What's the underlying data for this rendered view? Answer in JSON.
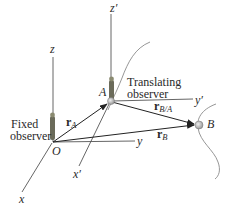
{
  "diagram": {
    "type": "relative-motion-translating-axes",
    "labels": {
      "fixed_z": "z",
      "fixed_x": "x",
      "fixed_y": "y",
      "origin": "O",
      "moving_z": "z′",
      "moving_x": "x′",
      "moving_y": "y′",
      "point_a": "A",
      "point_b": "B",
      "fixed_observer_line1": "Fixed",
      "fixed_observer_line2": "observer",
      "translating_observer_line1": "Translating",
      "translating_observer_line2": "observer"
    },
    "vectors": {
      "r_a": {
        "main": "r",
        "sub": "A"
      },
      "r_b": {
        "main": "r",
        "sub": "B"
      },
      "r_ba": {
        "main": "r",
        "sub": "B/A"
      }
    },
    "colors": {
      "axis": "#555555",
      "vector": "#222222",
      "path": "#8a8a8a",
      "particle": "#b8b8b8",
      "observer": "#6b6b5a"
    }
  }
}
